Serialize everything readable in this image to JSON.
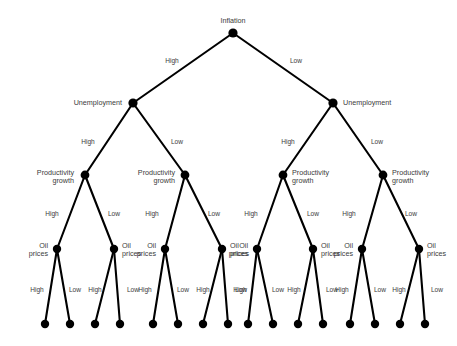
{
  "figure": {
    "width": 457,
    "height": 346,
    "background_color": "#ffffff",
    "node_color": "#000000",
    "edge_color": "#000000",
    "text_color": "#3b3b3b"
  },
  "variables": {
    "level1": "Inflation",
    "level2": "Unemployment",
    "level3": "Productivity\ngrowth",
    "level4": "Oil\nprices"
  },
  "branch_labels": {
    "high": "High",
    "low": "Low"
  },
  "nodes": [
    {
      "id": "root",
      "label": "Inflation",
      "x": 233,
      "y": 33,
      "r": 4.6,
      "anchor": "center",
      "lx": 233,
      "ly": 21
    },
    {
      "id": "n-h",
      "label": "Unemployment",
      "x": 133,
      "y": 103,
      "r": 4.6,
      "anchor": "left",
      "lx": 122,
      "ly": 103
    },
    {
      "id": "n-l",
      "label": "Unemployment",
      "x": 333,
      "y": 103,
      "r": 4.6,
      "anchor": "right",
      "lx": 343,
      "ly": 103
    },
    {
      "id": "n-hh",
      "label": "Productivity\ngrowth",
      "x": 85,
      "y": 175,
      "r": 4.4,
      "anchor": "left",
      "lx": 74,
      "ly": 177
    },
    {
      "id": "n-hl",
      "label": "Productivity\ngrowth",
      "x": 185,
      "y": 175,
      "r": 4.4,
      "anchor": "left",
      "lx": 175,
      "ly": 177
    },
    {
      "id": "n-lh",
      "label": "Productivity\ngrowth",
      "x": 283,
      "y": 175,
      "r": 4.4,
      "anchor": "right",
      "lx": 292,
      "ly": 177
    },
    {
      "id": "n-ll",
      "label": "Productivity\ngrowth",
      "x": 383,
      "y": 175,
      "r": 4.4,
      "anchor": "right",
      "lx": 392,
      "ly": 177
    },
    {
      "id": "n-hhh",
      "label": "Oil\nprices",
      "x": 57,
      "y": 249,
      "r": 4.2,
      "anchor": "left",
      "lx": 48,
      "ly": 250
    },
    {
      "id": "n-hhl",
      "label": "Oil\nprices",
      "x": 114,
      "y": 249,
      "r": 4.2,
      "anchor": "right",
      "lx": 122,
      "ly": 250
    },
    {
      "id": "n-hlh",
      "label": "Oil\nprices",
      "x": 165,
      "y": 249,
      "r": 4.2,
      "anchor": "left",
      "lx": 156,
      "ly": 250
    },
    {
      "id": "n-hll",
      "label": "Oil\nprices",
      "x": 222,
      "y": 249,
      "r": 4.2,
      "anchor": "right",
      "lx": 230,
      "ly": 250
    },
    {
      "id": "n-lhh",
      "label": "Oil\nprices",
      "x": 257,
      "y": 249,
      "r": 4.2,
      "anchor": "left",
      "lx": 248,
      "ly": 250
    },
    {
      "id": "n-lhl",
      "label": "Oil\nprices",
      "x": 313,
      "y": 249,
      "r": 4.2,
      "anchor": "right",
      "lx": 321,
      "ly": 250
    },
    {
      "id": "n-llh",
      "label": "Oil\nprices",
      "x": 362,
      "y": 249,
      "r": 4.2,
      "anchor": "left",
      "lx": 353,
      "ly": 250
    },
    {
      "id": "n-lll",
      "label": "Oil\nprices",
      "x": 419,
      "y": 249,
      "r": 4.2,
      "anchor": "right",
      "lx": 427,
      "ly": 250
    }
  ],
  "leaves": [
    {
      "id": "leaf-1",
      "x": 45,
      "y": 324,
      "r": 4.2
    },
    {
      "id": "leaf-2",
      "x": 70,
      "y": 324,
      "r": 4.2
    },
    {
      "id": "leaf-3",
      "x": 95,
      "y": 324,
      "r": 4.2
    },
    {
      "id": "leaf-4",
      "x": 120,
      "y": 324,
      "r": 4.2
    },
    {
      "id": "leaf-5",
      "x": 153,
      "y": 324,
      "r": 4.2
    },
    {
      "id": "leaf-6",
      "x": 178,
      "y": 324,
      "r": 4.2
    },
    {
      "id": "leaf-7",
      "x": 203,
      "y": 324,
      "r": 4.2
    },
    {
      "id": "leaf-8",
      "x": 228,
      "y": 324,
      "r": 4.2
    },
    {
      "id": "leaf-9",
      "x": 248,
      "y": 324,
      "r": 4.2
    },
    {
      "id": "leaf-10",
      "x": 273,
      "y": 324,
      "r": 4.2
    },
    {
      "id": "leaf-11",
      "x": 298,
      "y": 324,
      "r": 4.2
    },
    {
      "id": "leaf-12",
      "x": 323,
      "y": 324,
      "r": 4.2
    },
    {
      "id": "leaf-13",
      "x": 350,
      "y": 324,
      "r": 4.2
    },
    {
      "id": "leaf-14",
      "x": 375,
      "y": 324,
      "r": 4.2
    },
    {
      "id": "leaf-15",
      "x": 400,
      "y": 324,
      "r": 4.2
    },
    {
      "id": "leaf-16",
      "x": 425,
      "y": 324,
      "r": 4.2
    }
  ],
  "edges": [
    {
      "id": "e-root-h",
      "from": "root",
      "to": "n-h",
      "label": "High",
      "lx": 172,
      "ly": 61,
      "anchor": "center"
    },
    {
      "id": "e-root-l",
      "from": "root",
      "to": "n-l",
      "label": "Low",
      "lx": 296,
      "ly": 61,
      "anchor": "center"
    },
    {
      "id": "e-h-h",
      "from": "n-h",
      "to": "n-hh",
      "label": "High",
      "lx": 88,
      "ly": 142,
      "anchor": "center"
    },
    {
      "id": "e-h-l",
      "from": "n-h",
      "to": "n-hl",
      "label": "Low",
      "lx": 177,
      "ly": 142,
      "anchor": "center"
    },
    {
      "id": "e-l-h",
      "from": "n-l",
      "to": "n-lh",
      "label": "High",
      "lx": 288,
      "ly": 142,
      "anchor": "center"
    },
    {
      "id": "e-l-l",
      "from": "n-l",
      "to": "n-ll",
      "label": "Low",
      "lx": 377,
      "ly": 142,
      "anchor": "center"
    },
    {
      "id": "e-hh-h",
      "from": "n-hh",
      "to": "n-hhh",
      "label": "High",
      "lx": 52,
      "ly": 214,
      "anchor": "center"
    },
    {
      "id": "e-hh-l",
      "from": "n-hh",
      "to": "n-hhl",
      "label": "Low",
      "lx": 114,
      "ly": 214,
      "anchor": "center"
    },
    {
      "id": "e-hl-h",
      "from": "n-hl",
      "to": "n-hlh",
      "label": "High",
      "lx": 152,
      "ly": 214,
      "anchor": "center"
    },
    {
      "id": "e-hl-l",
      "from": "n-hl",
      "to": "n-hll",
      "label": "Low",
      "lx": 214,
      "ly": 214,
      "anchor": "center"
    },
    {
      "id": "e-lh-h",
      "from": "n-lh",
      "to": "n-lhh",
      "label": "High",
      "lx": 251,
      "ly": 214,
      "anchor": "center"
    },
    {
      "id": "e-lh-l",
      "from": "n-lh",
      "to": "n-lhl",
      "label": "Low",
      "lx": 313,
      "ly": 214,
      "anchor": "center"
    },
    {
      "id": "e-ll-h",
      "from": "n-ll",
      "to": "n-llh",
      "label": "High",
      "lx": 349,
      "ly": 214,
      "anchor": "center"
    },
    {
      "id": "e-ll-l",
      "from": "n-ll",
      "to": "n-lll",
      "label": "Low",
      "lx": 411,
      "ly": 214,
      "anchor": "center"
    },
    {
      "id": "e-hhh-h",
      "from": "n-hhh",
      "to": "leaf-1",
      "label": "High",
      "lx": 37,
      "ly": 290,
      "anchor": "center"
    },
    {
      "id": "e-hhh-l",
      "from": "n-hhh",
      "to": "leaf-2",
      "label": "Low",
      "lx": 75,
      "ly": 290,
      "anchor": "center"
    },
    {
      "id": "e-hhl-h",
      "from": "n-hhl",
      "to": "leaf-3",
      "label": "High",
      "lx": 95,
      "ly": 290,
      "anchor": "center"
    },
    {
      "id": "e-hhl-l",
      "from": "n-hhl",
      "to": "leaf-4",
      "label": "Low",
      "lx": 133,
      "ly": 290,
      "anchor": "center"
    },
    {
      "id": "e-hlh-h",
      "from": "n-hlh",
      "to": "leaf-5",
      "label": "High",
      "lx": 145,
      "ly": 290,
      "anchor": "center"
    },
    {
      "id": "e-hlh-l",
      "from": "n-hlh",
      "to": "leaf-6",
      "label": "Low",
      "lx": 183,
      "ly": 290,
      "anchor": "center"
    },
    {
      "id": "e-hll-h",
      "from": "n-hll",
      "to": "leaf-7",
      "label": "High",
      "lx": 203,
      "ly": 290,
      "anchor": "center"
    },
    {
      "id": "e-hll-l",
      "from": "n-hll",
      "to": "leaf-8",
      "label": "Low",
      "lx": 241,
      "ly": 290,
      "anchor": "center"
    },
    {
      "id": "e-lhh-h",
      "from": "n-lhh",
      "to": "leaf-9",
      "label": "High",
      "lx": 240,
      "ly": 290,
      "anchor": "center"
    },
    {
      "id": "e-lhh-l",
      "from": "n-lhh",
      "to": "leaf-10",
      "label": "Low",
      "lx": 278,
      "ly": 290,
      "anchor": "center"
    },
    {
      "id": "e-lhl-h",
      "from": "n-lhl",
      "to": "leaf-11",
      "label": "High",
      "lx": 294,
      "ly": 290,
      "anchor": "center"
    },
    {
      "id": "e-lhl-l",
      "from": "n-lhl",
      "to": "leaf-12",
      "label": "Low",
      "lx": 332,
      "ly": 290,
      "anchor": "center"
    },
    {
      "id": "e-llh-h",
      "from": "n-llh",
      "to": "leaf-13",
      "label": "High",
      "lx": 342,
      "ly": 290,
      "anchor": "center"
    },
    {
      "id": "e-llh-l",
      "from": "n-llh",
      "to": "leaf-14",
      "label": "Low",
      "lx": 380,
      "ly": 290,
      "anchor": "center"
    },
    {
      "id": "e-lll-h",
      "from": "n-lll",
      "to": "leaf-15",
      "label": "High",
      "lx": 399,
      "ly": 290,
      "anchor": "center"
    },
    {
      "id": "e-lll-l",
      "from": "n-lll",
      "to": "leaf-16",
      "label": "Low",
      "lx": 437,
      "ly": 290,
      "anchor": "center"
    }
  ]
}
